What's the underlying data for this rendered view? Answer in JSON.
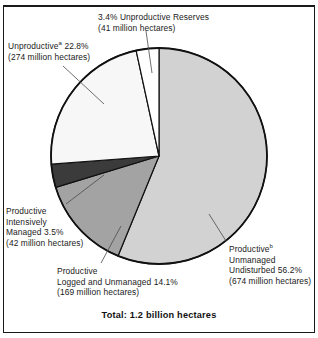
{
  "chart_data": {
    "type": "pie",
    "title": "",
    "total_caption": "Total: 1.2 billion hectares",
    "unit": "million hectares",
    "legend_position": "callout-labels",
    "categories": [
      "Productive Unmanaged Undisturbed",
      "Productive Logged and Unmanaged",
      "Productive Intensively Managed",
      "Unproductive",
      "Unproductive Reserves"
    ],
    "values": [
      56.2,
      14.1,
      3.5,
      22.8,
      3.4
    ],
    "absolute_values": [
      674,
      169,
      42,
      274,
      41
    ],
    "value_unit": "percent",
    "slices": [
      {
        "name": "productive-unmanaged-undisturbed",
        "label_line1": "Productive",
        "label_sup": "b",
        "label_line2": "Unmanaged",
        "label_line3": "Undisturbed 56.2%",
        "label_line4": "(674 million hectares)",
        "percent": 56.2,
        "hectares_millions": 674,
        "color": "#d2d2d2",
        "start_deg": 0,
        "end_deg": 202.32
      },
      {
        "name": "productive-logged-and-unmanaged",
        "label_line1": "Productive",
        "label_line2": "Logged and Unmanaged 14.1%",
        "label_line3": "(169 million hectares)",
        "percent": 14.1,
        "hectares_millions": 169,
        "color": "#a3a3a3",
        "start_deg": 202.32,
        "end_deg": 253.08
      },
      {
        "name": "productive-intensively-managed",
        "label_line1": "Productive",
        "label_line2": "Intensively",
        "label_line3": "Managed 3.5%",
        "label_line4": "(42 million hectares)",
        "percent": 3.5,
        "hectares_millions": 42,
        "color": "#3b3b3b",
        "start_deg": 253.08,
        "end_deg": 265.68
      },
      {
        "name": "unproductive",
        "label_line1": "Unproductive",
        "label_sup": "a",
        "label_line2": " 22.8%",
        "label_line3": "(274 million hectares)",
        "percent": 22.8,
        "hectares_millions": 274,
        "color": "#f7f7f7",
        "start_deg": 265.68,
        "end_deg": 347.76
      },
      {
        "name": "unproductive-reserves",
        "label_line1": "3.4% Unproductive Reserves",
        "label_line2": "(41 million hectares)",
        "percent": 3.4,
        "hectares_millions": 41,
        "color": "#ffffff",
        "start_deg": 347.76,
        "end_deg": 360
      }
    ]
  },
  "labels": {
    "reserves": {
      "line1": "3.4% Unproductive Reserves",
      "line2": "(41 million hectares)"
    },
    "unproductive": {
      "line1_text": "Unproductive",
      "line1_sup": "a",
      "line1_rest": " 22.8%",
      "line2": "(274 million hectares)"
    },
    "intensive": {
      "line1": "Productive",
      "line2": "Intensively",
      "line3": "Managed 3.5%",
      "line4": "(42 million hectares)"
    },
    "logged": {
      "line1": "Productive",
      "line2": "Logged and Unmanaged 14.1%",
      "line3": "(169 million hectares)"
    },
    "undisturbed": {
      "line1_text": "Productive",
      "line1_sup": "b",
      "line2": "Unmanaged",
      "line3": "Undisturbed 56.2%",
      "line4": "(674 million hectares)"
    }
  },
  "caption": {
    "total": "Total: 1.2 billion hectares"
  },
  "colors": {
    "outline": "#111111",
    "slice_undisturbed": "#d2d2d2",
    "slice_logged": "#a3a3a3",
    "slice_intensive": "#3b3b3b",
    "slice_unproductive": "#f7f7f7",
    "slice_reserves": "#ffffff",
    "text": "#1a1a1a",
    "background": "#ffffff"
  }
}
